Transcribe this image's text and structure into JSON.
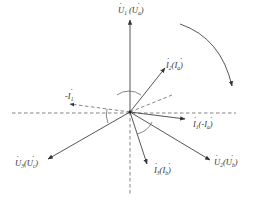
{
  "diagram": {
    "type": "phasor-diagram",
    "origin": [
      130,
      112
    ],
    "colors": {
      "line": "#444444",
      "text": "#333333",
      "background": "#ffffff"
    },
    "phasors": [
      {
        "id": "U1",
        "label": "U",
        "sub": "1",
        "alt": "U",
        "alt_sub": "a",
        "style": "solid",
        "end": [
          130,
          20
        ]
      },
      {
        "id": "U2",
        "label": "U",
        "sub": "2",
        "alt": "U",
        "alt_sub": "b",
        "style": "solid",
        "end": [
          210,
          158
        ]
      },
      {
        "id": "U3",
        "label": "U",
        "sub": "3",
        "alt": "U",
        "alt_sub": "c",
        "style": "solid",
        "end": [
          50,
          158
        ]
      },
      {
        "id": "I2",
        "label": "I",
        "sub": "2",
        "alt": "I",
        "alt_sub": "a",
        "style": "solid",
        "end": [
          166,
          67
        ]
      },
      {
        "id": "I1",
        "label": "I",
        "sub": "1",
        "alt": "-I",
        "alt_sub": "a",
        "style": "solid",
        "end": [
          186,
          119
        ]
      },
      {
        "id": "I3",
        "label": "I",
        "sub": "3",
        "alt": "I",
        "alt_sub": "b",
        "style": "solid",
        "end": [
          146,
          163
        ]
      },
      {
        "id": "negI1",
        "label": "-I",
        "sub": "1",
        "style": "dashed",
        "end": [
          72,
          105
        ]
      }
    ],
    "labels": {
      "u1": {
        "main": "U",
        "sub": "1",
        "paren_main": "U",
        "paren_sub": "a"
      },
      "i2": {
        "main": "I",
        "sub": "2",
        "paren_main": "I",
        "paren_sub": "a"
      },
      "neg_i1": {
        "main": "-I",
        "sub": "1"
      },
      "i1": {
        "main": "I",
        "sub": "1",
        "paren_main": "-I",
        "paren_sub": "a"
      },
      "u3": {
        "main": "U",
        "sub": "3",
        "paren_main": "U",
        "paren_sub": "c"
      },
      "i3": {
        "main": "I",
        "sub": "3",
        "paren_main": "I",
        "paren_sub": "b"
      },
      "u2": {
        "main": "U",
        "sub": "2",
        "paren_main": "U",
        "paren_sub": "b"
      }
    },
    "rotation_arrow": {
      "direction": "clockwise"
    }
  }
}
